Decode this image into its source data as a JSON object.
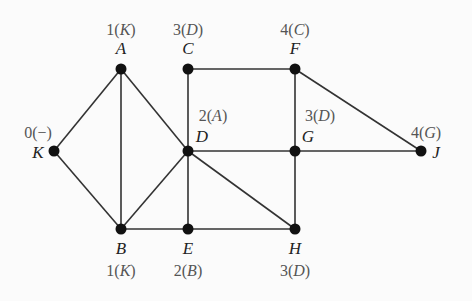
{
  "graph": {
    "nodes": [
      {
        "id": "A",
        "x": 121,
        "y": 69,
        "label": "1(K)",
        "name_pos": [
          121,
          54
        ],
        "label_pos": [
          121,
          35
        ]
      },
      {
        "id": "C",
        "x": 188,
        "y": 69,
        "label": "3(D)",
        "name_pos": [
          188,
          54
        ],
        "label_pos": [
          188,
          35
        ]
      },
      {
        "id": "F",
        "x": 295,
        "y": 69,
        "label": "4(C)",
        "name_pos": [
          295,
          54
        ],
        "label_pos": [
          295,
          35
        ]
      },
      {
        "id": "K",
        "x": 54,
        "y": 151,
        "label": "0(−)",
        "name_pos": [
          38,
          158
        ],
        "label_pos": [
          38,
          138
        ]
      },
      {
        "id": "D",
        "x": 188,
        "y": 151,
        "label": "2(A)",
        "name_pos": [
          202,
          142
        ],
        "label_pos": [
          213,
          121
        ]
      },
      {
        "id": "G",
        "x": 295,
        "y": 151,
        "label": "3(D)",
        "name_pos": [
          308,
          142
        ],
        "label_pos": [
          320,
          121
        ]
      },
      {
        "id": "J",
        "x": 421,
        "y": 151,
        "label": "4(G)",
        "name_pos": [
          436,
          158
        ],
        "label_pos": [
          426,
          138
        ]
      },
      {
        "id": "B",
        "x": 121,
        "y": 229,
        "label": "1(K)",
        "name_pos": [
          121,
          254
        ],
        "label_pos": [
          121,
          276
        ]
      },
      {
        "id": "E",
        "x": 188,
        "y": 229,
        "label": "2(B)",
        "name_pos": [
          188,
          254
        ],
        "label_pos": [
          188,
          276
        ]
      },
      {
        "id": "H",
        "x": 295,
        "y": 229,
        "label": "3(D)",
        "name_pos": [
          295,
          254
        ],
        "label_pos": [
          295,
          276
        ]
      }
    ],
    "edges": [
      [
        "K",
        "A"
      ],
      [
        "K",
        "B"
      ],
      [
        "A",
        "B"
      ],
      [
        "A",
        "D"
      ],
      [
        "C",
        "D"
      ],
      [
        "C",
        "F"
      ],
      [
        "F",
        "G"
      ],
      [
        "F",
        "J"
      ],
      [
        "D",
        "G"
      ],
      [
        "G",
        "J"
      ],
      [
        "D",
        "B"
      ],
      [
        "D",
        "E"
      ],
      [
        "D",
        "H"
      ],
      [
        "B",
        "E"
      ],
      [
        "E",
        "H"
      ],
      [
        "G",
        "H"
      ]
    ]
  }
}
